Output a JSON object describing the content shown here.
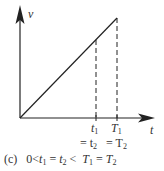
{
  "diagram": {
    "type": "velocity-time graph",
    "axes": {
      "y_label": "v",
      "x_label": "t"
    },
    "line": {
      "from": "origin",
      "to": "T1 peak",
      "description": "straight line from origin, constant acceleration"
    },
    "markers": [
      {
        "label_main": "t",
        "label_sub": "1",
        "eq_main": "= t",
        "eq_sub": "2"
      },
      {
        "label_main": "T",
        "label_sub": "1",
        "eq_main": "= T",
        "eq_sub": "2"
      }
    ],
    "caption": {
      "prefix": "(c)",
      "text": "0<t1 = t2 <  T1 = T2",
      "parts": [
        "0<",
        "t",
        "1",
        " = ",
        "t",
        "2",
        " <  ",
        "T",
        "1",
        " = ",
        "T",
        "2"
      ]
    },
    "colors": {
      "ink": "#222222",
      "background": "#ffffff"
    }
  }
}
